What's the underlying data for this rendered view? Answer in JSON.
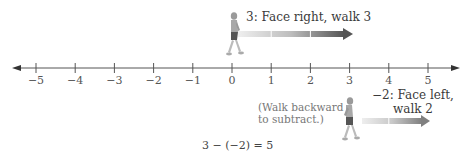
{
  "number_line": {
    "ticks": [
      "−5",
      "−4",
      "−3",
      "−2",
      "−1",
      "0",
      "1",
      "2",
      "3",
      "4",
      "5"
    ],
    "min": -5,
    "max": 5,
    "arrows_both_ends": true,
    "line_color": "#555555"
  },
  "step1": {
    "label": "3: Face right, walk 3",
    "from": 0,
    "to": 3,
    "direction": "right",
    "figure_facing": "right",
    "arrow_color_start": "#e6e6e6",
    "arrow_color_end": "#555555"
  },
  "step2": {
    "label_line1": "−2: Face left,",
    "label_line2": "walk 2",
    "from": 3,
    "to": 5,
    "direction": "right",
    "figure_facing": "left",
    "arrow_color_start": "#e6e6e6",
    "arrow_color_end": "#777777"
  },
  "note": {
    "line1": "(Walk backward",
    "line2": "to subtract.)"
  },
  "equation": "3 − (−2) = 5"
}
